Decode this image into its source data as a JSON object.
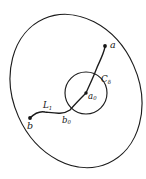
{
  "figure": {
    "kind": "mathematical-diagram",
    "background_color": "#ffffff",
    "stroke_color": "#1c1c1c"
  },
  "labels": {
    "point_a": {
      "text": "a",
      "base": "a",
      "subscript": ""
    },
    "point_b": {
      "text": "b",
      "base": "b",
      "subscript": ""
    },
    "point_a0": {
      "base": "a",
      "subscript": "0"
    },
    "point_b0": {
      "base": "b",
      "subscript": "0"
    },
    "circle_c_delta": {
      "base": "C",
      "subscript": "δ"
    },
    "path_l1": {
      "base": "L",
      "subscript": "1"
    }
  },
  "geometry": {
    "outer_region": {
      "name": "outer-ellipse",
      "cx": 76,
      "cy": 91,
      "rx": 63,
      "ry": 79,
      "rotation_deg": -24
    },
    "inner_circle": {
      "name": "circle-c-delta",
      "cx": 86,
      "cy": 93,
      "r": 21
    },
    "points": [
      {
        "name": "a",
        "x": 105,
        "y": 46,
        "r": 1.9
      },
      {
        "name": "b",
        "x": 30,
        "y": 118,
        "r": 1.9
      },
      {
        "name": "a0",
        "x": 86,
        "y": 93,
        "r": 1.7
      },
      {
        "name": "b0",
        "x": 70,
        "y": 110,
        "r": 0
      }
    ],
    "curve_upper": "M 105 47 C 103 56 99 62 96 70 C 93 78 89 86 86 93",
    "curve_lower": "M 86 93 C 81 98 76 103 70 110 C 63 115 54 113 45 112 C 40 111 35 113 30 118"
  }
}
